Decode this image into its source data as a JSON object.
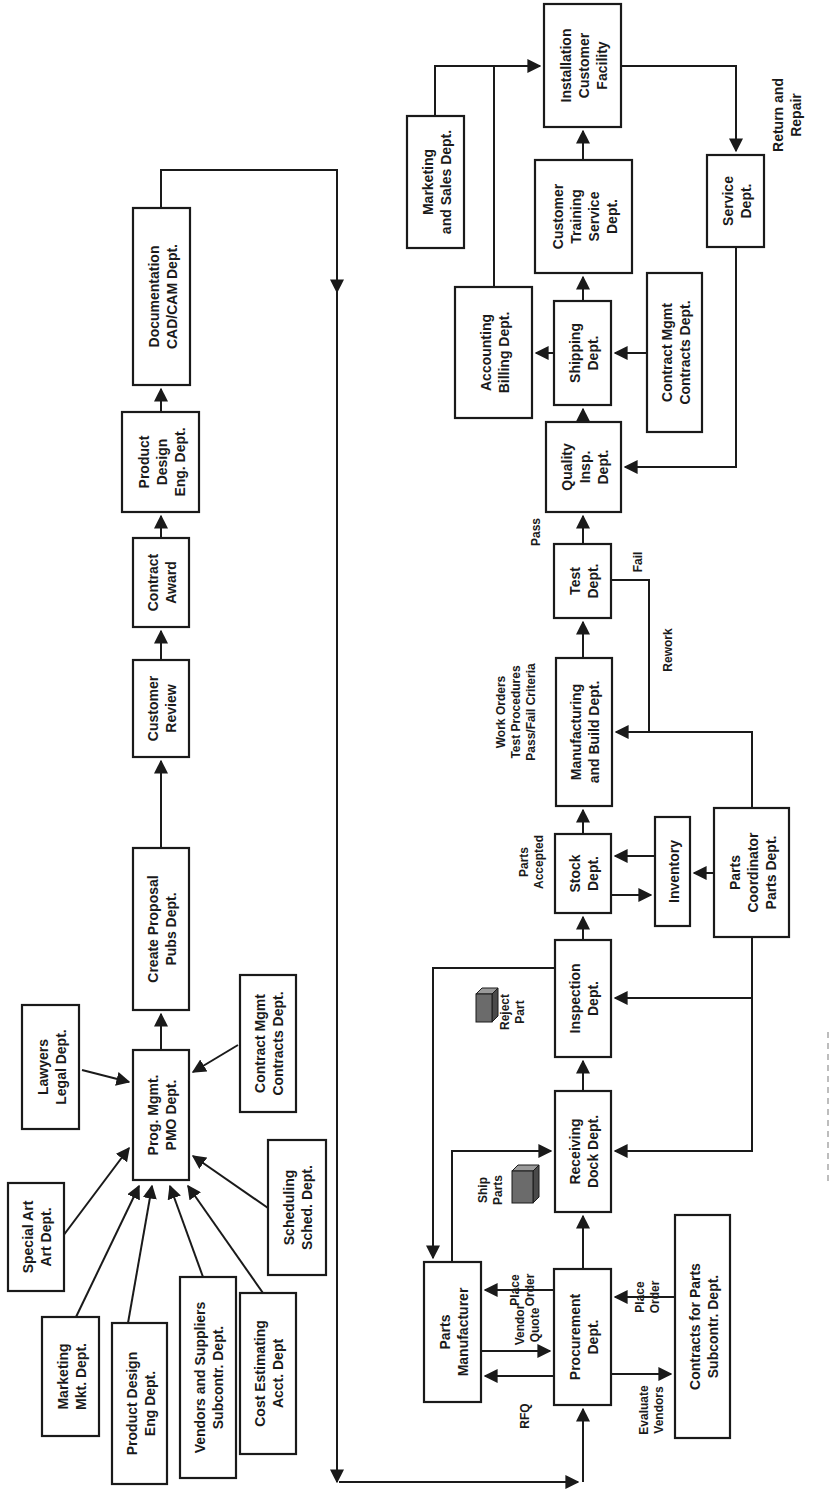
{
  "diagram": {
    "orientation": "rotated 90deg counter-clockwise",
    "nodes": {
      "special_art": [
        "Special Art",
        "Art Dept."
      ],
      "marketing_mkt": [
        "Marketing",
        "Mkt.  Dept."
      ],
      "product_design_eng": [
        "Product Design",
        "Eng Dept."
      ],
      "vendors_suppliers": [
        "Vendors and Suppliers",
        "Subcontr.  Dept."
      ],
      "cost_estimating": [
        "Cost Estimating",
        "Acct. Dept"
      ],
      "scheduling": [
        "Scheduling",
        "Sched. Dept."
      ],
      "lawyers": [
        "Lawyers",
        "Legal Dept."
      ],
      "prog_mgmt": [
        "Prog. Mgmt.",
        "PMO Dept."
      ],
      "contract_mgmt_left": [
        "Contract Mgmt",
        "Contracts Dept."
      ],
      "create_proposal": [
        "Create Proposal",
        "Pubs Dept."
      ],
      "customer_review": [
        "Customer",
        "Review"
      ],
      "contract_award": [
        "Contract",
        "Award"
      ],
      "product_design_top": [
        "Product",
        "Design",
        "Eng. Dept."
      ],
      "documentation": [
        "Documentation",
        "CAD/CAM Dept."
      ],
      "marketing_sales": [
        "Marketing",
        "and Sales Dept."
      ],
      "accounting_billing": [
        "Accounting",
        "Billing Dept."
      ],
      "installation": [
        "Installation",
        "Customer",
        "Facility"
      ],
      "customer_training": [
        "Customer",
        "Training",
        "Service",
        "Dept."
      ],
      "shipping": [
        "Shipping",
        "Dept."
      ],
      "contract_mgmt_right": [
        "Contract Mgmt",
        "Contracts Dept."
      ],
      "service": [
        "Service",
        "Dept."
      ],
      "quality": [
        "Quality",
        "Insp.",
        "Dept."
      ],
      "test": [
        "Test",
        "Dept."
      ],
      "manufacturing": [
        "Manufacturing",
        "and Build Dept."
      ],
      "stock": [
        "Stock",
        "Dept."
      ],
      "inventory": [
        "Inventory"
      ],
      "parts_coordinator": [
        "Parts",
        "Coordinator",
        "Parts Dept."
      ],
      "inspection": [
        "Inspection",
        "Dept."
      ],
      "receiving": [
        "Receiving",
        "Dock Dept."
      ],
      "parts_manufacturer": [
        "Parts",
        "Manufacturer"
      ],
      "procurement": [
        "Procurement",
        "Dept."
      ],
      "contracts_parts": [
        "Contracts for Parts",
        "Subcontr.  Dept."
      ]
    },
    "annotations": {
      "return_repair": [
        "Return and",
        "Repair"
      ],
      "pass": [
        "Pass"
      ],
      "fail": [
        "Fail"
      ],
      "rework": [
        "Rework"
      ],
      "work_orders": [
        "Work Orders",
        "Test Procedures",
        "Pass/Fail Criteria"
      ],
      "parts_accepted": [
        "Parts",
        "Accepted"
      ],
      "reject_part": [
        "Reject",
        "Part"
      ],
      "ship_parts": [
        "Ship",
        "Parts"
      ],
      "place_order_mfr": [
        "Place",
        "Order"
      ],
      "vendor_quote": [
        "Vendor",
        "Quote"
      ],
      "rfq": [
        "RFQ"
      ],
      "place_order_contracts": [
        "Place",
        "Order"
      ],
      "evaluate_vendors": [
        "Evaluate",
        "Vendors"
      ]
    },
    "icons": {
      "reject_part_icon": "box-cube-icon",
      "ship_parts_icon": "box-cube-icon"
    }
  }
}
